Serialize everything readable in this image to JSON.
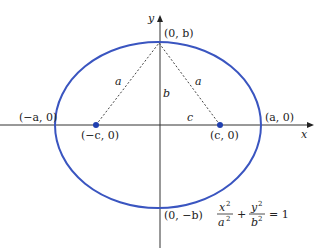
{
  "diagram": {
    "type": "ellipse-with-foci",
    "axes": {
      "x_label": "x",
      "y_label": "y"
    },
    "ellipse": {
      "color": "#3a55c0",
      "center": [
        0,
        0
      ]
    },
    "points": {
      "vertex_left": "(−a, 0)",
      "vertex_right": "(a, 0)",
      "covertex_top": "(0, b)",
      "covertex_bottom": "(0, −b)",
      "focus_left": "(−c, 0)",
      "focus_right": "(c, 0)"
    },
    "segments": {
      "left_slant": "a",
      "right_slant": "a",
      "vertical": "b",
      "horizontal": "c"
    },
    "equation": {
      "term1_num": "x",
      "term1_den": "a",
      "term2_num": "y",
      "term2_den": "b",
      "exp": "2",
      "plus": "+",
      "equals": "= 1"
    }
  }
}
